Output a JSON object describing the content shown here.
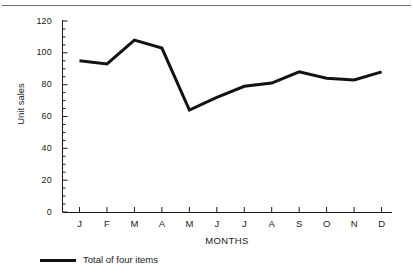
{
  "chart_data": {
    "type": "line",
    "title": "",
    "xlabel": "MONTHS",
    "ylabel": "Unit sales",
    "categories": [
      "J",
      "F",
      "M",
      "A",
      "M",
      "J",
      "J",
      "A",
      "S",
      "O",
      "N",
      "D"
    ],
    "series": [
      {
        "name": "Total of four items",
        "values": [
          95,
          93,
          108,
          103,
          64,
          72,
          79,
          81,
          88,
          84,
          83,
          88
        ],
        "color": "#121212",
        "line_width": 3,
        "markers": "none"
      }
    ],
    "ylim": [
      0,
      120
    ],
    "y_ticks": [
      0,
      20,
      40,
      60,
      80,
      100,
      120
    ],
    "y_minor_tick_step": 5,
    "x_ticks": [
      "J",
      "F",
      "M",
      "A",
      "M",
      "J",
      "J",
      "A",
      "S",
      "O",
      "N",
      "D"
    ],
    "grid": false,
    "legend_position": "below-left",
    "axis_color": "#1a1a1a",
    "background": "#ffffff"
  },
  "legend": {
    "entries": [
      {
        "label": "Total of four items",
        "swatch": "line-swatch"
      }
    ]
  },
  "axes": {
    "y_title": "Unit sales",
    "x_title": "MONTHS",
    "y_tick_labels": [
      "120",
      "100",
      "80",
      "60",
      "40",
      "20",
      "0"
    ],
    "x_tick_labels": [
      "J",
      "F",
      "M",
      "A",
      "M",
      "J",
      "J",
      "A",
      "S",
      "O",
      "N",
      "D"
    ]
  },
  "decor": {
    "top_rule": "horizontal-rule"
  }
}
